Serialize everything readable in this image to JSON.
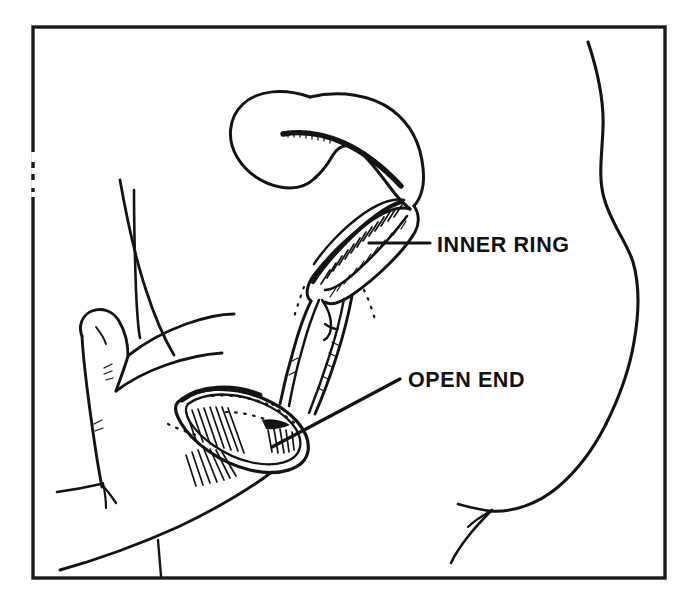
{
  "figure": {
    "kind": "line-art instructional diagram",
    "background_color": "#ffffff",
    "ink_color": "#141414",
    "canvas": {
      "width": 687,
      "height": 608
    }
  },
  "frame": {
    "name": "border-frame",
    "x": 33,
    "y": 27,
    "width": 632,
    "height": 551,
    "stroke_color": "#1a1a1a",
    "stroke_width": 3.4
  },
  "labels": [
    {
      "id": "inner-ring",
      "text": "INNER RING",
      "x": 437,
      "y": 252,
      "leader": {
        "x1": 369,
        "y1": 243,
        "x2": 430,
        "y2": 243
      }
    },
    {
      "id": "open-end",
      "text": "OPEN END",
      "x": 408,
      "y": 387,
      "leader": {
        "x1": 272,
        "y1": 447,
        "x2": 400,
        "y2": 379
      }
    }
  ],
  "parts": [
    {
      "id": "closed-end-loop",
      "label": "closed end of condom"
    },
    {
      "id": "inner-ring-shape",
      "label": "inner ring"
    },
    {
      "id": "condom-sheath",
      "label": "condom sheath"
    },
    {
      "id": "open-end-rim",
      "label": "open end outer rim"
    },
    {
      "id": "hand-thumb",
      "label": "thumb"
    },
    {
      "id": "hand-finger",
      "label": "index finger"
    },
    {
      "id": "hand-palm",
      "label": "palm and hand edge"
    },
    {
      "id": "body-torso-curve",
      "label": "body torso outline"
    },
    {
      "id": "body-thigh-curve",
      "label": "thigh outline"
    }
  ]
}
